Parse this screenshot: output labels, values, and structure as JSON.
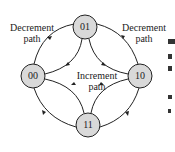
{
  "diagram": {
    "type": "state-diagram",
    "nodes": [
      {
        "id": "01",
        "label": "01"
      },
      {
        "id": "00",
        "label": "00"
      },
      {
        "id": "10",
        "label": "10"
      },
      {
        "id": "11",
        "label": "11"
      }
    ],
    "labels": {
      "decrement_left_line1": "Decrement",
      "decrement_left_line2": "path",
      "decrement_right_line1": "Decrement",
      "decrement_right_line2": "path",
      "increment_line1": "Increment",
      "increment_line2": "path"
    },
    "edges": [
      {
        "from": "01",
        "to": "00",
        "path": "decrement"
      },
      {
        "from": "00",
        "to": "11",
        "path": "decrement"
      },
      {
        "from": "11",
        "to": "10",
        "path": "decrement"
      },
      {
        "from": "10",
        "to": "01",
        "path": "decrement"
      },
      {
        "from": "00",
        "to": "01",
        "path": "increment"
      },
      {
        "from": "01",
        "to": "10",
        "path": "increment"
      },
      {
        "from": "10",
        "to": "11",
        "path": "increment"
      },
      {
        "from": "11",
        "to": "00",
        "path": "increment"
      }
    ],
    "colors": {
      "node_fill": "#d9d9d9",
      "stroke": "#222222"
    }
  }
}
